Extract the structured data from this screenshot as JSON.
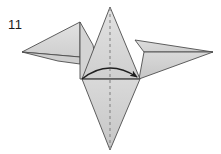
{
  "figure": {
    "step_label": "11",
    "caption": "",
    "type": "origami-fold-diagram",
    "background_color": "#ffffff"
  },
  "colors": {
    "paper_light": "#dcdcdc",
    "paper_mid": "#d2d2d2",
    "paper_dark": "#c9c9c9",
    "paper_shadow": "#bfbfbf",
    "edge_stroke": "#4d4d4d",
    "fold_dashed": "#8c8c8c",
    "arrow_stroke": "#1f1f1f",
    "label_text": "#1a1a1a"
  },
  "geometry": {
    "canvas": {
      "width": 221,
      "height": 154
    },
    "points": {
      "center_apex": [
        110,
        7
      ],
      "center_left": [
        82,
        79
      ],
      "center_right": [
        140,
        79
      ],
      "bottom_tip": [
        110,
        150
      ],
      "left_wing_top": [
        80,
        22
      ],
      "left_wing_tip": [
        22,
        52
      ],
      "left_wing_inner_low": [
        80,
        58
      ],
      "right_wing_top": [
        135,
        40
      ],
      "right_wing_tip": [
        213,
        52
      ],
      "right_wing_mid": [
        143,
        52
      ]
    },
    "shapes": [
      {
        "name": "left-wing-upper",
        "points": "80,22 22,52 80,58"
      },
      {
        "name": "left-wing-lower",
        "points": "80,58 22,52 62,62 80,66"
      },
      {
        "name": "left-neck-panel",
        "points": "80,22 80,79 97,79 91,45"
      },
      {
        "name": "center-upper-triangle",
        "points": "110,7 82,79 140,79"
      },
      {
        "name": "center-lower-triangle",
        "points": "82,79 140,79 110,150"
      },
      {
        "name": "right-wing-upper",
        "points": "135,40 213,52 143,52"
      },
      {
        "name": "right-wing-lower",
        "points": "143,52 213,52 140,79"
      }
    ],
    "fold_line": {
      "name": "vertical-center-crease",
      "x": 110,
      "y1": 8,
      "y2": 150,
      "style": "dashed"
    },
    "arrow": {
      "name": "fold-direction-arrow",
      "start": [
        82,
        79
      ],
      "control": [
        108,
        60
      ],
      "end": [
        139,
        78
      ],
      "head_size": 7,
      "style": "curved-solid"
    }
  }
}
